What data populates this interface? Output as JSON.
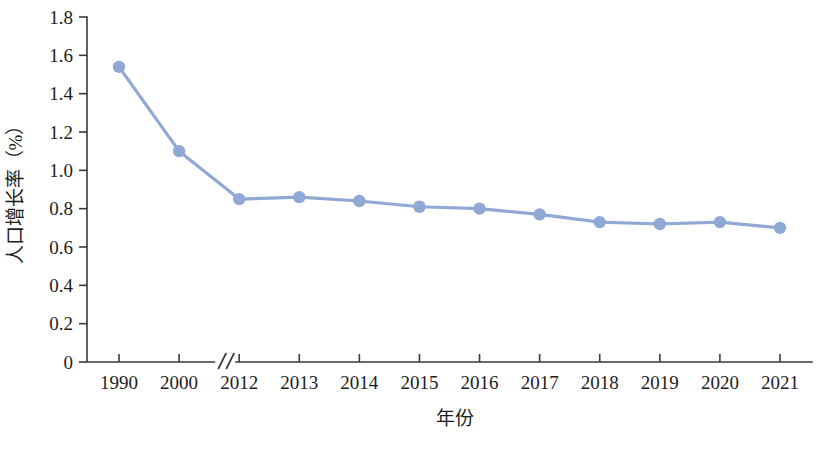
{
  "chart_data": {
    "type": "line",
    "title": "",
    "xlabel": "年份",
    "ylabel": "人口增长率（%）",
    "categories": [
      "1990",
      "2000",
      "2012",
      "2013",
      "2014",
      "2015",
      "2016",
      "2017",
      "2018",
      "2019",
      "2020",
      "2021"
    ],
    "values": [
      1.54,
      1.1,
      0.85,
      0.86,
      0.84,
      0.81,
      0.8,
      0.77,
      0.73,
      0.72,
      0.73,
      0.7
    ],
    "series": [
      {
        "name": "人口增长率",
        "values": [
          1.54,
          1.1,
          0.85,
          0.86,
          0.84,
          0.81,
          0.8,
          0.77,
          0.73,
          0.72,
          0.73,
          0.7
        ]
      }
    ],
    "ylim": [
      0,
      1.8
    ],
    "yticks": [
      "0",
      "0.2",
      "0.4",
      "0.6",
      "0.8",
      "1.0",
      "1.2",
      "1.4",
      "1.6",
      "1.8"
    ],
    "ytick_values": [
      0,
      0.2,
      0.4,
      0.6,
      0.8,
      1.0,
      1.2,
      1.4,
      1.6,
      1.8
    ],
    "grid": false,
    "legend": false,
    "legend_position": "none",
    "axis_break": {
      "present": true,
      "between": [
        "2000",
        "2012"
      ],
      "symbol": "//"
    },
    "colors": {
      "series_line": "#8FA8D4",
      "series_marker": "#8FA8D4",
      "axis": "#3A3A3A",
      "text": "#1D1D1D",
      "background": "#FFFFFF"
    },
    "style": {
      "line_width": 3.2,
      "marker_radius": 6.2,
      "marker_shape": "circle"
    }
  }
}
